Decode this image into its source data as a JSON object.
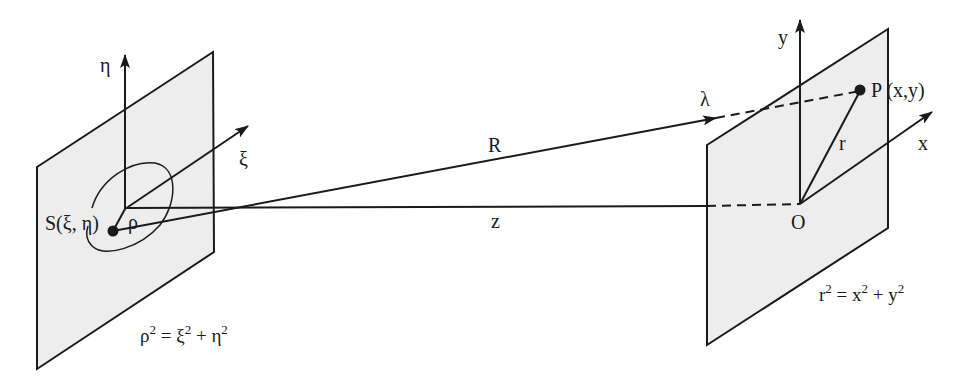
{
  "diagram": {
    "type": "optics-geometry",
    "colors": {
      "line": "#1a1a1a",
      "plane_fill": "#ededed",
      "background": "#ffffff"
    },
    "source_plane": {
      "axis_vertical": "η",
      "axis_horizontal": "ξ",
      "point_label": "S(ξ, η)",
      "radius_label": "ρ",
      "equation": {
        "lhs": "ρ",
        "lhs_exp": "2",
        "eq": " = ",
        "t1": "ξ",
        "t1_exp": "2",
        "plus": " + ",
        "t2": "η",
        "t2_exp": "2"
      }
    },
    "observation_plane": {
      "axis_vertical": "y",
      "axis_horizontal": "x",
      "origin_label": "O",
      "point_label": "P (x,y)",
      "radius_label": "r",
      "equation": {
        "lhs": "r",
        "lhs_exp": "2",
        "eq": " = ",
        "t1": "x",
        "t1_exp": "2",
        "plus": " + ",
        "t2": "y",
        "t2_exp": "2"
      }
    },
    "connections": {
      "slant_distance_label": "R",
      "axial_distance_label": "z",
      "wavelength_label": "λ"
    }
  }
}
